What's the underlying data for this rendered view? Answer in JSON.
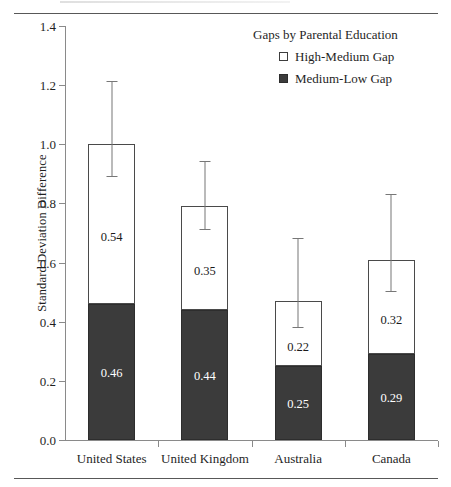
{
  "chart_data": {
    "type": "bar",
    "subtype": "stacked-bar-with-error-bars",
    "title": "",
    "xlabel": "",
    "ylabel": "Standard Deviation Difference",
    "ylim": [
      0.0,
      1.4
    ],
    "ytick_labels": [
      "0.0",
      "0.2",
      "0.4",
      "0.6",
      "0.8",
      "1.0",
      "1.2",
      "1.4"
    ],
    "ytick_values": [
      0.0,
      0.2,
      0.4,
      0.6,
      0.8,
      1.0,
      1.2,
      1.4
    ],
    "grid": false,
    "legend_position": "top-right",
    "legend_title": "Gaps by Parental Education",
    "categories": [
      "United States",
      "United Kingdom",
      "Australia",
      "Canada"
    ],
    "series": [
      {
        "name": "Medium-Low Gap",
        "color": "#3b3b3b",
        "stack_order": "bottom",
        "values": [
          0.46,
          0.44,
          0.25,
          0.29
        ],
        "labels": [
          "0.46",
          "0.44",
          "0.25",
          "0.29"
        ]
      },
      {
        "name": "High-Medium Gap",
        "color": "#ffffff",
        "stack_order": "top",
        "values": [
          0.54,
          0.35,
          0.22,
          0.32
        ],
        "labels": [
          "0.54",
          "0.35",
          "0.22",
          "0.32"
        ]
      }
    ],
    "totals": [
      1.0,
      0.79,
      0.47,
      0.61
    ],
    "error_bars": {
      "applies_to": "stack_total",
      "upper": [
        1.21,
        0.94,
        0.68,
        0.83
      ],
      "lower": [
        0.89,
        0.71,
        0.38,
        0.5
      ]
    }
  },
  "legend": {
    "title": "Gaps by Parental Education",
    "entries": [
      {
        "label": "High-Medium Gap",
        "swatch": "open-square",
        "color": "#ffffff"
      },
      {
        "label": "Medium-Low Gap",
        "swatch": "filled-square",
        "color": "#3b3b3b"
      }
    ]
  },
  "axes": {
    "y_title": "Standard Deviation Difference",
    "y_ticks": [
      "1.4",
      "1.2",
      "1.0",
      "0.8",
      "0.6",
      "0.4",
      "0.2",
      "0.0"
    ],
    "x_labels": [
      "United States",
      "United Kingdom",
      "Australia",
      "Canada"
    ]
  },
  "colors": {
    "bar_dark": "#3b3b3b",
    "bar_light": "#ffffff",
    "axis": "#8a8a8a",
    "error_bar": "#777777",
    "text": "#1f1f1f"
  }
}
